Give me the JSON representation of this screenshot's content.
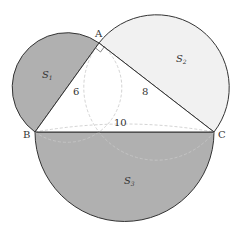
{
  "diagram": {
    "type": "geometry",
    "vertices": {
      "A": {
        "label": "A",
        "x": 99,
        "y": 43
      },
      "B": {
        "label": "B",
        "x": 35,
        "y": 132
      },
      "C": {
        "label": "C",
        "x": 214,
        "y": 132
      }
    },
    "sides": {
      "AB": {
        "label": "6"
      },
      "AC": {
        "label": "8"
      },
      "BC": {
        "label": "10"
      }
    },
    "regions": {
      "S1": {
        "label": "S",
        "sub": "1",
        "fill": "#b0b0b0"
      },
      "S2": {
        "label": "S",
        "sub": "2",
        "fill": "#f1f1f1"
      },
      "S3": {
        "label": "S",
        "sub": "3",
        "fill": "#b0b0b0"
      }
    },
    "right_angle_at": "A",
    "colors": {
      "stroke": "#333333",
      "dashed": "#c8c8c8",
      "dark_fill": "#b0b0b0",
      "light_fill": "#f1f1f1"
    }
  }
}
